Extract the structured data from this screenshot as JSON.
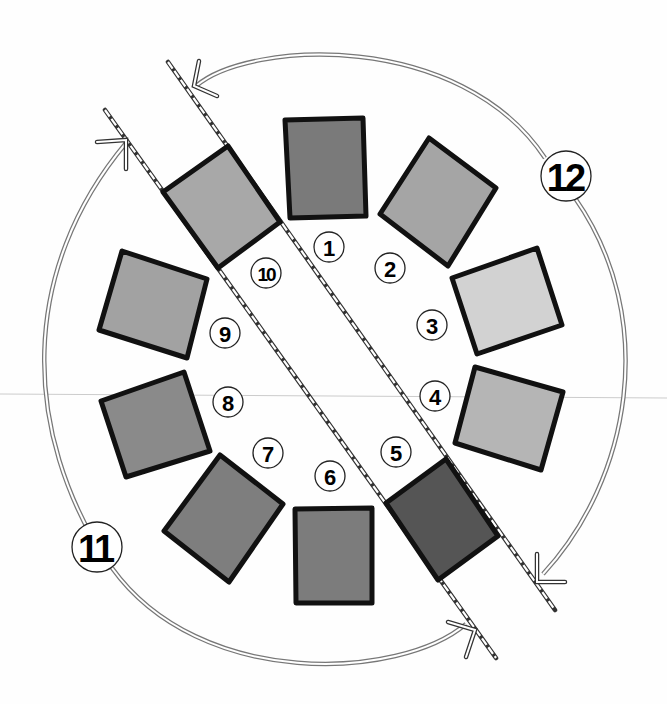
{
  "diagram": {
    "type": "rotation-diagram",
    "colors": {
      "outline": "#111111",
      "arc": "#777777",
      "background": "#fefefe"
    },
    "panels": [
      {
        "id": 1,
        "label": "1",
        "fill": "#7a7a7a",
        "points": "285,120 363,118 366,216 290,218",
        "label_pos": [
          329,
          247
        ]
      },
      {
        "id": 2,
        "label": "2",
        "fill": "#a5a5a5",
        "points": "429,138 496,188 448,266 380,214",
        "label_pos": [
          390,
          268
        ]
      },
      {
        "id": 3,
        "label": "3",
        "fill": "#d2d2d2",
        "points": "452,278 537,248 562,325 477,354",
        "label_pos": [
          432,
          325
        ]
      },
      {
        "id": 4,
        "label": "4",
        "fill": "#b5b5b5",
        "points": "475,367 563,392 541,470 455,443",
        "label_pos": [
          435,
          396
        ]
      },
      {
        "id": 5,
        "label": "5",
        "fill": "#555555",
        "points": "386,503 446,459 498,536 438,580",
        "label_pos": [
          396,
          452
        ]
      },
      {
        "id": 6,
        "label": "6",
        "fill": "#7c7c7c",
        "points": "295,509 372,508 372,603 296,603",
        "label_pos": [
          330,
          476
        ]
      },
      {
        "id": 7,
        "label": "7",
        "fill": "#7e7e7e",
        "points": "164,531 220,455 283,504 229,582",
        "label_pos": [
          268,
          453
        ]
      },
      {
        "id": 8,
        "label": "8",
        "fill": "#8a8a8a",
        "points": "101,401 184,372 210,451 126,477",
        "label_pos": [
          228,
          402
        ]
      },
      {
        "id": 9,
        "label": "9",
        "fill": "#a2a2a2",
        "points": "122,251 207,279 187,358 99,330",
        "label_pos": [
          225,
          333
        ]
      },
      {
        "id": 10,
        "label": "10",
        "fill": "#a8a8a8",
        "points": "163,192 228,146 280,222 218,268",
        "label_pos": [
          266,
          273
        ]
      }
    ],
    "axes": [
      {
        "name": "axis-left",
        "from": [
          105,
          110
        ],
        "to": [
          496,
          658
        ]
      },
      {
        "name": "axis-right",
        "from": [
          168,
          62
        ],
        "to": [
          555,
          610
        ]
      }
    ],
    "arrows": [
      {
        "id": 11,
        "label": "11",
        "path": "M 109 565 C 20 430, 20 270, 126 143",
        "path2": "M 110 572 C 200 690, 400 680, 466 624",
        "label_pos": [
          97,
          547
        ]
      },
      {
        "id": 12,
        "label": "12",
        "path": "M 547 160 C 460 30, 250 40, 196 86",
        "path2": "M 573 200 C 660 320, 630 480, 543 574",
        "label_pos": [
          566,
          176
        ]
      }
    ],
    "circle_labels": [
      "1",
      "2",
      "3",
      "4",
      "5",
      "6",
      "7",
      "8",
      "9",
      "10"
    ],
    "arc_labels": [
      "11",
      "12"
    ]
  }
}
